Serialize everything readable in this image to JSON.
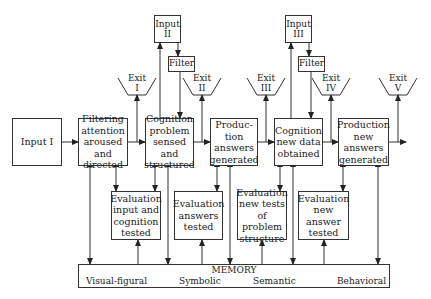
{
  "diagram": {
    "inputs": {
      "input_1": "Input I",
      "input_2": "Input\nII",
      "input_3": "Input\nIII"
    },
    "filters": [
      "Filter",
      "Filter"
    ],
    "process_boxes": [
      "Filtering\nattention\naroused and\ndirected",
      "Cognition\nproblem\nsensed and\nstructured",
      "Produc-\ntion\nanswers\ngenerated",
      "Cognition\nnew data\nobtained",
      "Production\nnew\nanswers\ngenerated"
    ],
    "exits": [
      "Exit\nI",
      "Exit\nII",
      "Exit\nIII",
      "Exit\nIV",
      "Exit\nV"
    ],
    "evaluation_boxes": [
      "Evaluation\ninput and\ncognition\ntested",
      "Evaluation\nanswers\ntested",
      "Evaluation\nnew tests\nof problem\nstructure",
      "Evaluation\nnew answer\ntested"
    ],
    "memory": {
      "title": "MEMORY",
      "categories": [
        "Visual-figural",
        "Symbolic",
        "Semantic",
        "Behavioral"
      ]
    }
  }
}
